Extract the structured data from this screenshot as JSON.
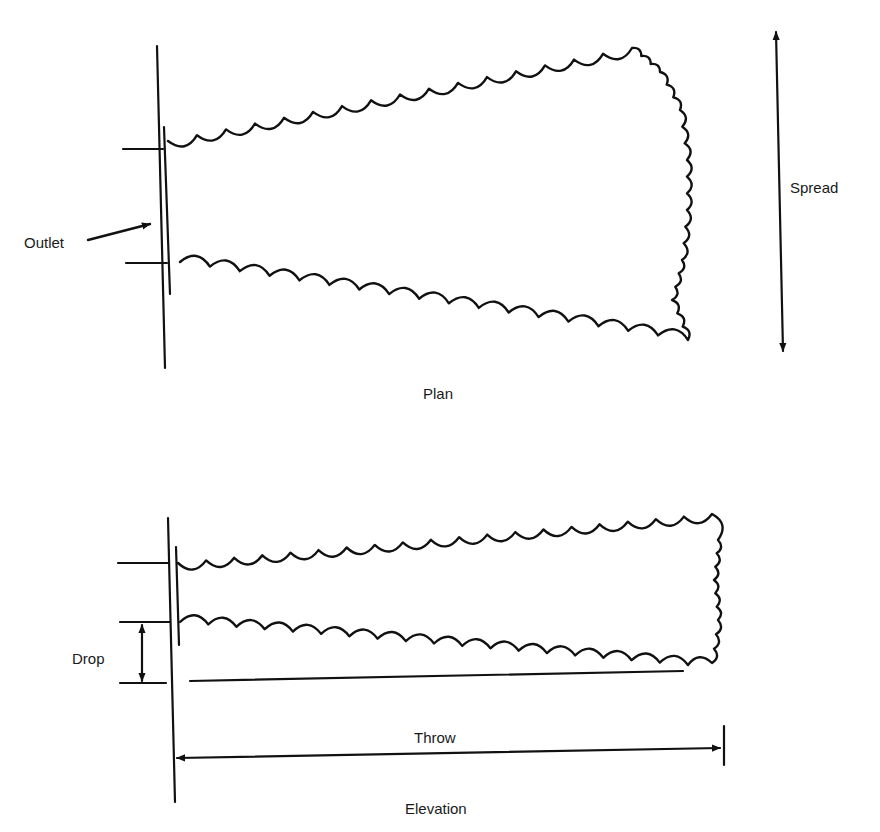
{
  "diagram": {
    "stroke_color": "#111111",
    "background": "#ffffff",
    "plan": {
      "caption": "Plan",
      "outlet_label": "Outlet",
      "spread_label": "Spread"
    },
    "elevation": {
      "caption": "Elevation",
      "drop_label": "Drop",
      "throw_label": "Throw"
    }
  }
}
